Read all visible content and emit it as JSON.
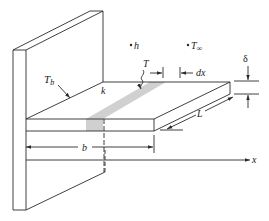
{
  "figure": {
    "labels": {
      "base_temp": "T",
      "base_temp_sub": "b",
      "conductivity": "k",
      "convection_coeff": "h",
      "ambient_temp": "T",
      "ambient_temp_sub": "∞",
      "local_temp": "T",
      "element_width": "dx",
      "thickness": "δ",
      "length": "L",
      "width": "b",
      "axis": "x"
    },
    "colors": {
      "line": "#2a2a2a",
      "shaded_element": "#d0d0d0",
      "background": "#ffffff"
    }
  }
}
